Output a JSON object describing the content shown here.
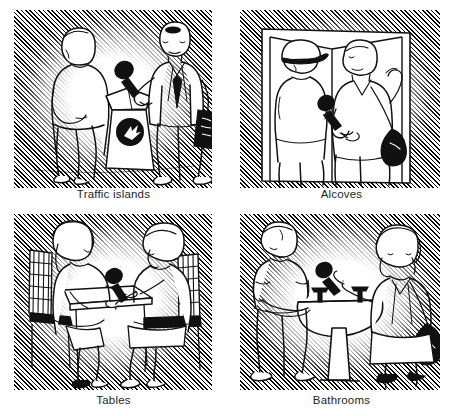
{
  "figure": {
    "layout": "2x2 grid of captioned line-drawing panels",
    "style": "black-and-white cartoon line art with diagonal hatched vignette backgrounds"
  },
  "panels": [
    {
      "id": "traffic-islands",
      "caption": "Traffic islands",
      "position": "top-left",
      "scene": "A reporter in a suit jacket and tie, holding a microphone and carrying a briefcase, interviews a man standing beside a street trash receptacle marked with a circular arrow symbol.",
      "objects": [
        "reporter",
        "interviewee",
        "microphone",
        "briefcase",
        "trash-receptacle",
        "arrow-logo"
      ]
    },
    {
      "id": "alcoves",
      "caption": "Alcoves",
      "position": "top-right",
      "scene": "Inside a wall alcove, a reporter holds a microphone toward a man wearing a baseball cap; the reporter carries a shoulder bag and rests an arm against the wall.",
      "objects": [
        "reporter",
        "interviewee",
        "baseball-cap",
        "microphone",
        "shoulder-bag",
        "alcove-walls"
      ]
    },
    {
      "id": "tables",
      "caption": "Tables",
      "position": "bottom-left",
      "scene": "Two people sit on slat-backed chairs across a small table; a microphone rests on the table between them during the interview.",
      "objects": [
        "interviewer",
        "interviewee",
        "table",
        "chair-left",
        "chair-right",
        "microphone"
      ]
    },
    {
      "id": "bathrooms",
      "caption": "Bathrooms",
      "position": "bottom-right",
      "scene": "A woman reporter with a shoulder bag extends a microphone toward a man washing his hands at a pedestal sink with two faucet handles.",
      "objects": [
        "reporter",
        "interviewee",
        "microphone",
        "shoulder-bag",
        "pedestal-sink",
        "faucet-handles"
      ]
    }
  ],
  "colors": {
    "ink": "#1a1a1a",
    "paper": "#ffffff",
    "hatch": "#000000"
  }
}
